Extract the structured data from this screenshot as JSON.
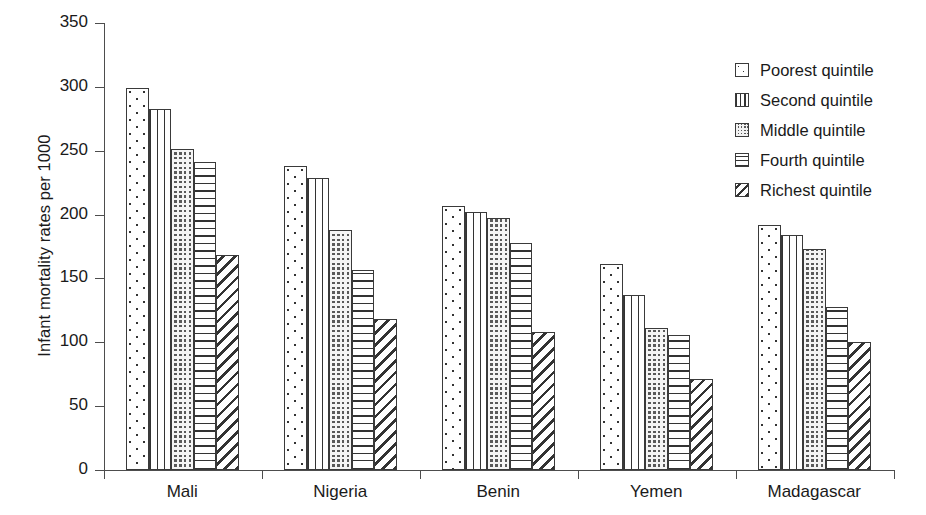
{
  "chart_data": {
    "type": "bar",
    "title": "",
    "subtitle": "",
    "xlabel": "",
    "ylabel": "Infant mortality rates per 1000",
    "categories": [
      "Mali",
      "Nigeria",
      "Benin",
      "Yemen",
      "Madagascar"
    ],
    "series": [
      {
        "name": "Poorest quintile",
        "pattern": "dots",
        "values": [
          299,
          238,
          207,
          161,
          192
        ]
      },
      {
        "name": "Second quintile",
        "pattern": "vert",
        "values": [
          283,
          229,
          202,
          137,
          184
        ]
      },
      {
        "name": "Middle quintile",
        "pattern": "grid",
        "values": [
          251,
          188,
          197,
          111,
          173
        ]
      },
      {
        "name": "Fourth quintile",
        "pattern": "horz",
        "values": [
          241,
          157,
          178,
          106,
          128
        ]
      },
      {
        "name": "Richest quintile",
        "pattern": "diag",
        "values": [
          168,
          118,
          108,
          71,
          100
        ]
      }
    ],
    "ylim": [
      0,
      350
    ],
    "yticks": [
      0,
      50,
      100,
      150,
      200,
      250,
      300,
      350
    ],
    "ytick_labels": [
      "0",
      "50",
      "100",
      "150",
      "200",
      "250",
      "300",
      "350"
    ],
    "grid": false,
    "legend_position": "top-right",
    "legend_entries": [
      "Poorest quintile",
      "Second quintile",
      "Middle quintile",
      "Fourth quintile",
      "Richest quintile"
    ],
    "colors": {
      "axis": "#4d4d4d",
      "bar_outline": "#3a3a3a",
      "bar_fill": "#ffffff",
      "hatch": "#333333",
      "text": "#1a1a1a",
      "background": "#ffffff"
    }
  }
}
